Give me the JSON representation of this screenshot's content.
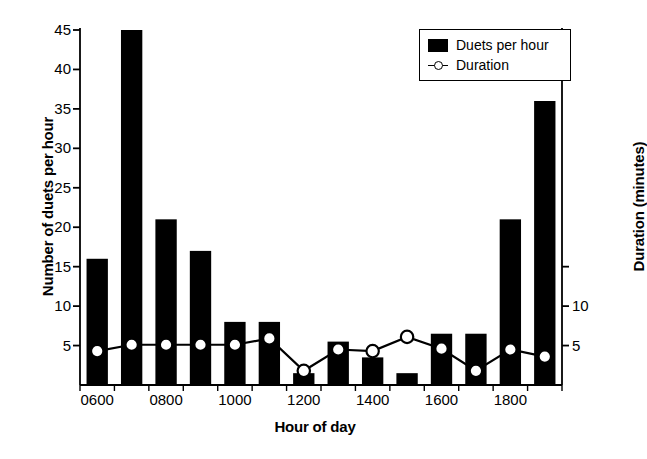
{
  "chart_data": {
    "type": "bar",
    "title": "",
    "xlabel": "Hour of day",
    "ylabel": "Number of duets per hour",
    "ylabel_secondary": "Duration (minutes)",
    "categories": [
      "0600",
      "0700",
      "0800",
      "0900",
      "1000",
      "1100",
      "1200",
      "1300",
      "1400",
      "1500",
      "1600",
      "1700",
      "1800",
      "1900"
    ],
    "xtick_labels": [
      "0600",
      "0800",
      "1000",
      "1200",
      "1400",
      "1600",
      "1800"
    ],
    "ytick_labels_left": [
      "5",
      "10",
      "15",
      "20",
      "25",
      "30",
      "35",
      "40",
      "45"
    ],
    "ytick_values_left": [
      5,
      10,
      15,
      20,
      25,
      30,
      35,
      40,
      45
    ],
    "ytick_labels_right": [
      "5",
      "10"
    ],
    "ytick_values_right": [
      5,
      10
    ],
    "ylim": [
      0,
      45
    ],
    "ylim_secondary": [
      0,
      45
    ],
    "grid": false,
    "legend_position": "upper right",
    "series": [
      {
        "name": "Duets per hour",
        "type": "bar",
        "axis": "left",
        "color": "#000000",
        "values": [
          16,
          45,
          21,
          17,
          8,
          8,
          1.5,
          5.5,
          3.5,
          1.5,
          6.5,
          6.5,
          21,
          36
        ]
      },
      {
        "name": "Duration",
        "type": "line",
        "axis": "right",
        "color": "#000000",
        "marker": "open-circle",
        "values": [
          4.3,
          5.1,
          5.1,
          5.1,
          5.1,
          5.9,
          1.8,
          4.5,
          4.3,
          6.1,
          4.6,
          1.8,
          4.5,
          3.6
        ]
      }
    ]
  },
  "legend": {
    "items": [
      {
        "label": "Duets per hour",
        "swatch": "filled-square"
      },
      {
        "label": "Duration",
        "swatch": "line-circle-marker"
      }
    ]
  }
}
